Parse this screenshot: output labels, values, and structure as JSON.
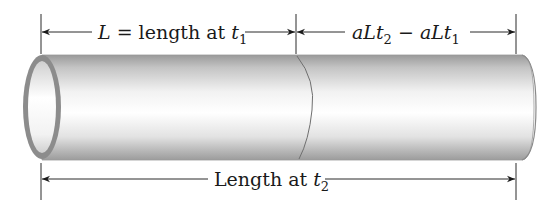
{
  "diagram": {
    "type": "thermal-expansion-pipe",
    "colors": {
      "line": "#2a2a2a",
      "pipe_edge": "#8a8a8a",
      "pipe_shade": "#bdbdbd",
      "pipe_highlight": "#ffffff",
      "rim": "#8c8c8c"
    },
    "top_left_dimension": {
      "var": "L",
      "text": " = length at ",
      "t_var": "t",
      "t_sub": "1"
    },
    "top_right_dimension": {
      "a1": "aLt",
      "sub1": "2",
      "minus": " − ",
      "a2": "aLt",
      "sub2": "1"
    },
    "bottom_dimension": {
      "text": "Length at ",
      "t_var": "t",
      "t_sub": "2"
    }
  }
}
